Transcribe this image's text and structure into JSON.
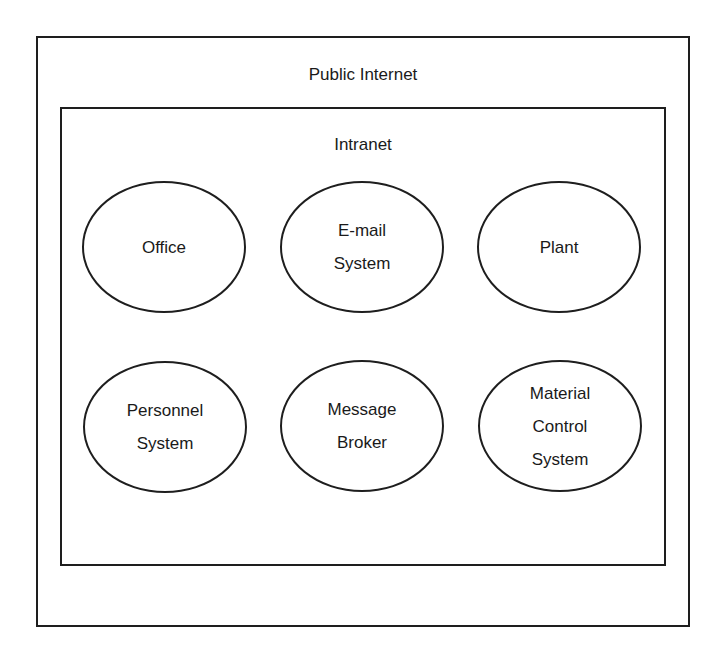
{
  "diagram": {
    "outer_zone": {
      "label": "Public Internet"
    },
    "inner_zone": {
      "label": "Intranet"
    },
    "nodes": [
      {
        "id": "office",
        "lines": [
          "Office"
        ]
      },
      {
        "id": "email",
        "lines": [
          "E-mail",
          "System"
        ]
      },
      {
        "id": "plant",
        "lines": [
          "Plant"
        ]
      },
      {
        "id": "personnel",
        "lines": [
          "Personnel",
          "System"
        ]
      },
      {
        "id": "broker",
        "lines": [
          "Message",
          "Broker"
        ]
      },
      {
        "id": "material",
        "lines": [
          "Material",
          "Control",
          "System"
        ]
      }
    ],
    "colors": {
      "stroke": "#1e1e1e",
      "background": "#ffffff",
      "text": "#1a1a1a"
    }
  }
}
